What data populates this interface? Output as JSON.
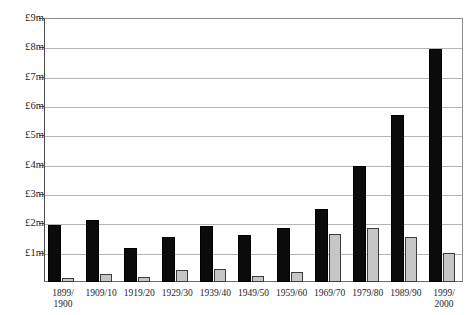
{
  "chart_data": {
    "type": "bar",
    "title": "",
    "xlabel": "",
    "ylabel": "",
    "ylim": [
      0,
      9
    ],
    "grid": true,
    "legend": "none",
    "y_unit": "£m",
    "y_ticks": [
      {
        "value": 9,
        "label": "£9m"
      },
      {
        "value": 8,
        "label": "£8m"
      },
      {
        "value": 7,
        "label": "£7m"
      },
      {
        "value": 6,
        "label": "£6m"
      },
      {
        "value": 5,
        "label": "£5m"
      },
      {
        "value": 4,
        "label": "£4m"
      },
      {
        "value": 3,
        "label": "£3m"
      },
      {
        "value": 2,
        "label": "£2m"
      },
      {
        "value": 1,
        "label": "£1m"
      }
    ],
    "categories": [
      "1899/\n1900",
      "1909/10",
      "1919/20",
      "1929/30",
      "1939/40",
      "1949/50",
      "1959/60",
      "1969/70",
      "1979/80",
      "1989/90",
      "1999/\n2000"
    ],
    "series": [
      {
        "name": "black",
        "color": "#0b0b0b",
        "values": [
          1.95,
          2.1,
          1.15,
          1.55,
          1.9,
          1.6,
          1.85,
          2.5,
          3.95,
          5.7,
          7.95
        ]
      },
      {
        "name": "grey",
        "color": "#c6c6c6",
        "values": [
          0.12,
          0.28,
          0.18,
          0.42,
          0.45,
          0.22,
          0.35,
          1.65,
          1.85,
          1.55,
          1.0
        ]
      }
    ]
  }
}
